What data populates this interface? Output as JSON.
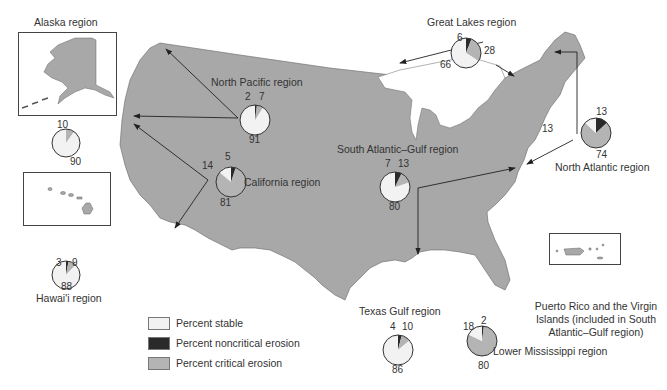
{
  "colors": {
    "land": "#a8a8a8",
    "stable": "#f2f2f2",
    "noncritical": "#2a2a2a",
    "critical": "#b4b4b4",
    "outline": "#444444"
  },
  "legend": [
    {
      "key": "stable",
      "label": "Percent stable"
    },
    {
      "key": "noncritical",
      "label": "Percent noncritical erosion"
    },
    {
      "key": "critical",
      "label": "Percent critical erosion"
    }
  ],
  "regions": {
    "alaska": {
      "label": "Alaska region",
      "stable": 90,
      "noncritical": 0,
      "critical": 10,
      "labels": [
        "10",
        "90"
      ]
    },
    "hawaii": {
      "label": "Hawai'i region",
      "stable": 88,
      "noncritical": 3,
      "critical": 9,
      "labels": [
        "3",
        "9",
        "88"
      ]
    },
    "north_pacific": {
      "label": "North Pacific region",
      "stable": 91,
      "noncritical": 2,
      "critical": 7,
      "labels": [
        "2",
        "7",
        "91"
      ]
    },
    "california": {
      "label": "California region",
      "stable": 14,
      "noncritical": 5,
      "critical": 81,
      "labels": [
        "14",
        "5",
        "81"
      ]
    },
    "great_lakes": {
      "label": "Great Lakes region",
      "stable": 66,
      "noncritical": 6,
      "critical": 28,
      "labels": [
        "6",
        "28",
        "66"
      ]
    },
    "north_atlantic": {
      "label": "North Atlantic region",
      "stable": 13,
      "noncritical": 13,
      "critical": 74,
      "labels": [
        "13",
        "13",
        "74"
      ]
    },
    "south_atlantic_gulf": {
      "label": "South Atlantic–Gulf region",
      "stable": 80,
      "noncritical": 7,
      "critical": 13,
      "labels": [
        "7",
        "13",
        "80"
      ]
    },
    "texas_gulf": {
      "label": "Texas Gulf region",
      "stable": 86,
      "noncritical": 4,
      "critical": 10,
      "labels": [
        "4",
        "10",
        "86"
      ]
    },
    "lower_mississippi": {
      "label": "Lower Mississippi region",
      "stable": 18,
      "noncritical": 2,
      "critical": 80,
      "labels": [
        "18",
        "2",
        "80"
      ]
    }
  },
  "puerto_rico_caption": "Puerto Rico and the Virgin Islands (included in South Atlantic–Gulf region)"
}
